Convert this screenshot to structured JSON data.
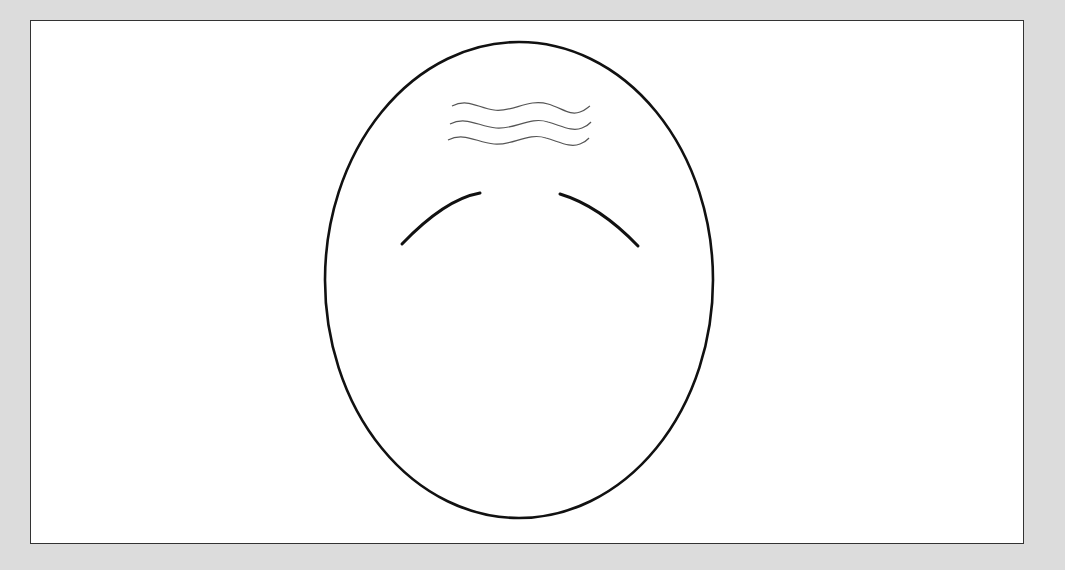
{
  "diagram": {
    "title": "",
    "colors": {
      "background": "#dcdcdc",
      "panel": "#ffffff",
      "outline": "#111111",
      "wrinkles": "#555555"
    },
    "shapes": {
      "head": {
        "cx": 519,
        "cy": 280,
        "rx": 194,
        "ry": 238
      },
      "wrinkle_count": 3,
      "eyebrow_count": 2
    }
  }
}
